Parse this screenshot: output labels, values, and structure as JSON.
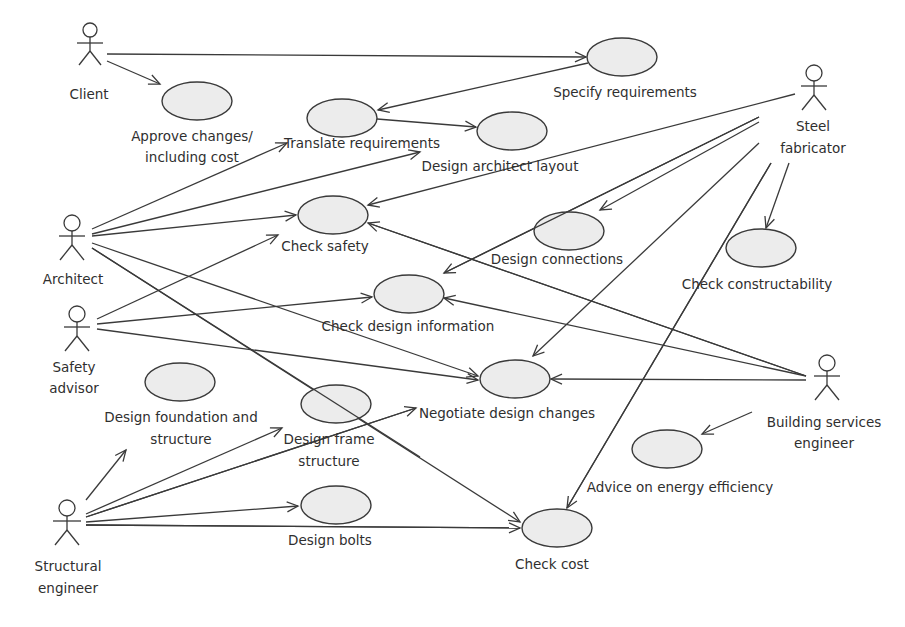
{
  "diagram": {
    "type": "UML use case diagram",
    "colors": {
      "line": "#3a3a3a",
      "usecase_fill": "#ececec",
      "text": "#2f2f2f",
      "background": "#ffffff"
    },
    "actors": [
      {
        "id": "client",
        "label": "Client",
        "x": 90,
        "y": 30
      },
      {
        "id": "architect",
        "label": "Architect",
        "x": 72,
        "y": 225
      },
      {
        "id": "safety",
        "label": "Safety\nadvisor",
        "label_lines": [
          "Safety",
          "advisor"
        ],
        "x": 77,
        "y": 316
      },
      {
        "id": "structural",
        "label": "Structural\nengineer",
        "label_lines": [
          "Structural",
          "engineer"
        ],
        "x": 67,
        "y": 505
      },
      {
        "id": "steel",
        "label": "Steel\nfabricator",
        "label_lines": [
          "Steel",
          "fabricator"
        ],
        "x": 815,
        "y": 73
      },
      {
        "id": "building",
        "label": "Building services\nengineer",
        "label_lines": [
          "Building services",
          "engineer"
        ],
        "x": 827,
        "y": 368
      }
    ],
    "use_cases": [
      {
        "id": "specify",
        "label": "Specify requirements",
        "cx": 622,
        "cy": 57
      },
      {
        "id": "approve",
        "label": "Approve changes/ including cost",
        "label_lines": [
          "Approve changes/",
          "including cost"
        ],
        "cx": 197,
        "cy": 101
      },
      {
        "id": "translate",
        "label": "Translate requirements",
        "cx": 342,
        "cy": 118
      },
      {
        "id": "layout",
        "label": "Design architect layout",
        "cx": 512,
        "cy": 131
      },
      {
        "id": "safety_check",
        "label": "Check safety",
        "cx": 333,
        "cy": 215
      },
      {
        "id": "connections",
        "label": "Design connections",
        "cx": 569,
        "cy": 231
      },
      {
        "id": "constructability",
        "label": "Check constructability",
        "cx": 761,
        "cy": 248
      },
      {
        "id": "design_info",
        "label": "Check design information",
        "cx": 409,
        "cy": 294
      },
      {
        "id": "negotiate",
        "label": "Negotiate design changes",
        "cx": 515,
        "cy": 379
      },
      {
        "id": "foundation",
        "label": "Design foundation and structure",
        "label_lines": [
          "Design foundation and",
          "structure"
        ],
        "cx": 180,
        "cy": 382
      },
      {
        "id": "frame",
        "label": "Design frame structure",
        "label_lines": [
          "Design frame",
          "structure"
        ],
        "cx": 336,
        "cy": 404
      },
      {
        "id": "energy",
        "label": "Advice on energy efficiency",
        "cx": 667,
        "cy": 449
      },
      {
        "id": "bolts",
        "label": "Design bolts",
        "cx": 336,
        "cy": 505
      },
      {
        "id": "cost",
        "label": "Check cost",
        "cx": 557,
        "cy": 528
      }
    ],
    "associations": [
      [
        "client",
        "specify"
      ],
      [
        "client",
        "approve"
      ],
      [
        "specify",
        "translate"
      ],
      [
        "translate",
        "layout"
      ],
      [
        "architect",
        "translate"
      ],
      [
        "architect",
        "layout"
      ],
      [
        "architect",
        "safety_check"
      ],
      [
        "architect",
        "negotiate"
      ],
      [
        "architect",
        "cost"
      ],
      [
        "safety",
        "safety_check"
      ],
      [
        "safety",
        "design_info"
      ],
      [
        "safety",
        "negotiate"
      ],
      [
        "structural",
        "foundation"
      ],
      [
        "structural",
        "frame"
      ],
      [
        "structural",
        "negotiate"
      ],
      [
        "structural",
        "bolts"
      ],
      [
        "structural",
        "cost"
      ],
      [
        "steel",
        "safety_check"
      ],
      [
        "steel",
        "design_info"
      ],
      [
        "steel",
        "connections"
      ],
      [
        "steel",
        "negotiate"
      ],
      [
        "steel",
        "cost"
      ],
      [
        "steel",
        "constructability"
      ],
      [
        "building",
        "safety_check"
      ],
      [
        "building",
        "design_info"
      ],
      [
        "building",
        "negotiate"
      ],
      [
        "building",
        "energy"
      ]
    ]
  },
  "labels": {
    "client": "Client",
    "architect": "Architect",
    "safety_1": "Safety",
    "safety_2": "advisor",
    "structural_1": "Structural",
    "structural_2": "engineer",
    "steel_1": "Steel",
    "steel_2": "fabricator",
    "building_1": "Building services",
    "building_2": "engineer",
    "specify": "Specify requirements",
    "approve_1": "Approve changes/",
    "approve_2": "including cost",
    "translate": "Translate requirements",
    "layout": "Design architect layout",
    "safety_check": "Check safety",
    "connections": "Design connections",
    "constructability": "Check constructability",
    "design_info": "Check design information",
    "negotiate": "Negotiate design changes",
    "foundation_1": "Design foundation and",
    "foundation_2": "structure",
    "frame_1": "Design frame",
    "frame_2": "structure",
    "energy": "Advice on energy efficiency",
    "bolts": "Design bolts",
    "cost": "Check cost"
  }
}
